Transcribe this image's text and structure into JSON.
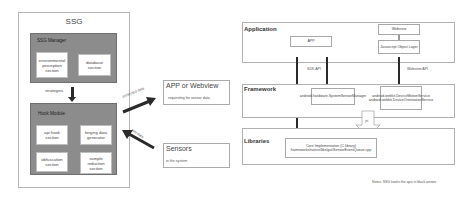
{
  "ssg": {
    "title": "SSG",
    "manager": {
      "title": "SSG Manager",
      "cells": [
        "environmental perception section",
        "database section"
      ]
    },
    "strategies_label": "strategies",
    "hook_module": {
      "title": "Hook Module",
      "cells": [
        "api hook section",
        "forging data generator",
        "obfuscation section",
        "sample reduction section"
      ]
    }
  },
  "flows": {
    "protected_data": "protected data",
    "raw_data": "raw data"
  },
  "app_box": {
    "title": "APP or Webview",
    "subtitle": "requesting for sensor data"
  },
  "sensors_box": {
    "title": "Sensors",
    "subtitle": "in the system"
  },
  "architecture": {
    "application": {
      "title": "Application",
      "app": "APP",
      "webview": "Webview",
      "js_object": "Javascript Object Layer"
    },
    "sdk_api": "SDK API",
    "webview_api": "Webview API",
    "ndk_api": "NDK API",
    "framework": {
      "title": "Framework",
      "sensor_manager": "android.hardware.SystemSensorManager",
      "webkit": "android.webkit.DeviceMotionService android.webkit.DeviceOrientationService"
    },
    "jni": "jni",
    "libraries": {
      "title": "Libraries",
      "core": "Core Implementation (C library) frameworks/native/libs/gui/SensorEventQueue.cpp"
    },
    "note": "Notes: SSG hooks the apis in black arrows"
  }
}
